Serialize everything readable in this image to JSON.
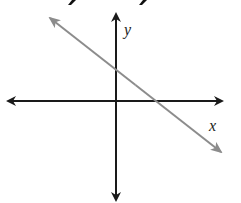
{
  "diagram": {
    "type": "coordinate-plane-with-line",
    "axes": {
      "x_label": "x",
      "y_label": "y",
      "color": "#1a1a1a",
      "origin_px": [
        116,
        101
      ],
      "x_axis_px": [
        8,
        222
      ],
      "y_axis_px": [
        14,
        200
      ]
    },
    "line": {
      "color": "#8c8c8c",
      "slope_sign": "negative",
      "start_px": [
        50,
        18
      ],
      "end_px": [
        221,
        152
      ],
      "y_intercept_px": [
        116,
        68
      ],
      "x_intercept_px": [
        169,
        101
      ],
      "description": "Line with negative slope, positive y-intercept and positive x-intercept"
    },
    "top_cropped_glyphs": [
      "y",
      "y"
    ]
  }
}
